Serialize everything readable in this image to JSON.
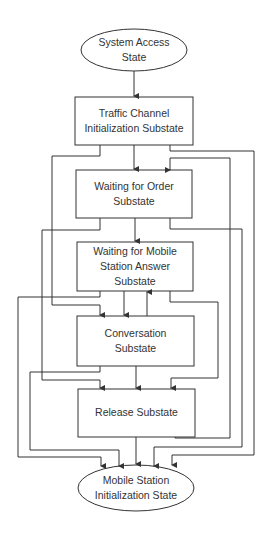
{
  "diagram": {
    "type": "state-flow",
    "nodes": [
      {
        "id": "system-access",
        "shape": "ellipse",
        "lines": [
          "System Access",
          "State"
        ]
      },
      {
        "id": "traffic-channel-init",
        "shape": "rect",
        "lines": [
          "Traffic Channel",
          "Initialization Substate"
        ]
      },
      {
        "id": "waiting-for-order",
        "shape": "rect",
        "lines": [
          "Waiting for Order",
          "Substate"
        ]
      },
      {
        "id": "waiting-for-ms-answer",
        "shape": "rect",
        "lines": [
          "Waiting for Mobile",
          "Station Answer",
          "Substate"
        ]
      },
      {
        "id": "conversation",
        "shape": "rect",
        "lines": [
          "Conversation",
          "Substate"
        ]
      },
      {
        "id": "release",
        "shape": "rect",
        "lines": [
          "Release Substate"
        ]
      },
      {
        "id": "ms-init",
        "shape": "ellipse",
        "lines": [
          "Mobile Station",
          "Initialization State"
        ]
      }
    ],
    "edges": [
      {
        "from": "system-access",
        "to": "traffic-channel-init"
      },
      {
        "from": "traffic-channel-init",
        "to": "waiting-for-order"
      },
      {
        "from": "traffic-channel-init",
        "to": "conversation"
      },
      {
        "from": "traffic-channel-init",
        "to": "ms-init"
      },
      {
        "from": "waiting-for-order",
        "to": "waiting-for-ms-answer"
      },
      {
        "from": "waiting-for-order",
        "to": "release"
      },
      {
        "from": "waiting-for-order",
        "to": "ms-init"
      },
      {
        "from": "waiting-for-ms-answer",
        "to": "conversation"
      },
      {
        "from": "waiting-for-ms-answer",
        "to": "release"
      },
      {
        "from": "waiting-for-ms-answer",
        "to": "ms-init"
      },
      {
        "from": "conversation",
        "to": "waiting-for-ms-answer"
      },
      {
        "from": "conversation",
        "to": "release"
      },
      {
        "from": "conversation",
        "to": "ms-init"
      },
      {
        "from": "release",
        "to": "ms-init"
      },
      {
        "from": "release",
        "to": "waiting-for-order"
      }
    ]
  },
  "colors": {
    "line": "#333333",
    "text": "#333333",
    "background": "#ffffff"
  }
}
